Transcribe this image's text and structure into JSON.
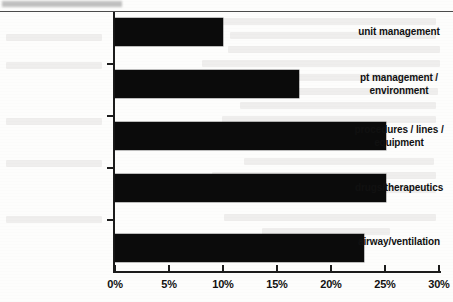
{
  "chart_data": {
    "type": "bar",
    "orientation": "horizontal",
    "title": "",
    "xlabel": "",
    "ylabel": "",
    "xlim": [
      0,
      30
    ],
    "xtick_labels": [
      "0%",
      "5%",
      "10%",
      "15%",
      "20%",
      "25%",
      "30%"
    ],
    "xtick_values": [
      0,
      5,
      10,
      15,
      20,
      25,
      30
    ],
    "grid": false,
    "legend": false,
    "bar_color": "#0b0b0b",
    "axis_color": "#1c1c1c",
    "categories": [
      "unit management",
      "pt management / environment",
      "procedures / lines / equipment",
      "drugs/therapeutics",
      "airway/ventilation"
    ],
    "values": [
      10,
      17,
      25,
      25,
      23
    ],
    "bars": [
      {
        "label_line1": "unit management",
        "label_line2": "",
        "value": 10
      },
      {
        "label_line1": "pt management /",
        "label_line2": "environment",
        "value": 17
      },
      {
        "label_line1": "procedures / lines /",
        "label_line2": "equipment",
        "value": 25
      },
      {
        "label_line1": "drugs/therapeutics",
        "label_line2": "",
        "value": 25
      },
      {
        "label_line1": "airway/ventilation",
        "label_line2": "",
        "value": 23
      }
    ]
  }
}
